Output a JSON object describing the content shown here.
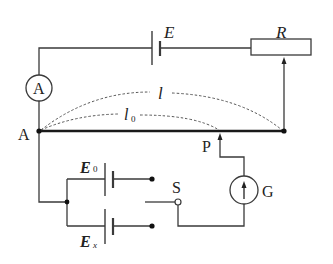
{
  "diagram": {
    "labels": {
      "source_emf": "E",
      "rheostat": "R",
      "ammeter": "A",
      "node_a": "A",
      "total_length": "l",
      "length0_main": "l",
      "length0_sub": "0",
      "slider_point": "P",
      "switch": "S",
      "galvanometer": "G",
      "std_cell_main": "E",
      "std_cell_sub": "0",
      "unknown_cell_main": "E",
      "unknown_cell_sub": "x"
    },
    "colors": {
      "wire": "#3a3a3a",
      "thick_wire": "#1a1a1a",
      "dashed": "#555555"
    }
  }
}
